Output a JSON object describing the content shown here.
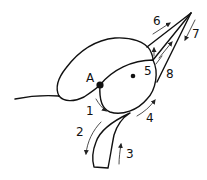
{
  "diagram": {
    "point_label": "A",
    "labels": {
      "l1": "1",
      "l2": "2",
      "l3": "3",
      "l4": "4",
      "l5": "5",
      "l6": "6",
      "l7": "7",
      "l8": "8"
    },
    "colors": {
      "stroke": "#111111",
      "background": "#ffffff"
    }
  }
}
